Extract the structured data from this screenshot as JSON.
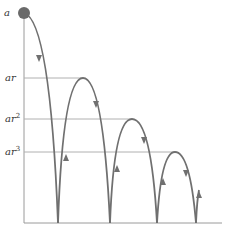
{
  "diagram": {
    "title": "",
    "colors": {
      "curve": "#707070",
      "axis": "#9a9a9a",
      "guide": "#b0b0b0",
      "ball": "#6a6a6a",
      "label": "#333333"
    },
    "labels": {
      "a": {
        "base": "a",
        "exp": ""
      },
      "ar": {
        "base": "ar",
        "exp": ""
      },
      "ar2": {
        "base": "ar",
        "exp": "2"
      },
      "ar3": {
        "base": "ar",
        "exp": "3"
      }
    },
    "heights": [
      "a",
      "ar",
      "ar^2",
      "ar^3"
    ],
    "bounce_points_x": [
      58,
      110,
      157,
      196
    ],
    "peaks": [
      {
        "label": "ar",
        "x": 83,
        "y": 78
      },
      {
        "label": "ar^2",
        "x": 132,
        "y": 119
      },
      {
        "label": "ar^3",
        "x": 175,
        "y": 152
      }
    ]
  }
}
